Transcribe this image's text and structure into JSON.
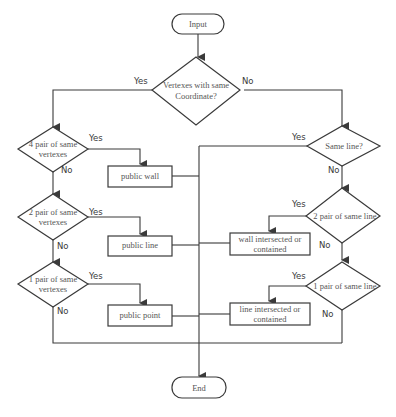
{
  "diagram": {
    "type": "flowchart",
    "nodes": {
      "start": {
        "label": "Input",
        "shape": "terminator"
      },
      "d_same_coord": {
        "line1": "Vertexes with same",
        "line2": "Coordinate?",
        "shape": "decision"
      },
      "d_4pair": {
        "line1": "4 pair of same",
        "line2": "vertexes",
        "shape": "decision"
      },
      "d_2pair": {
        "line1": "2 pair of same",
        "line2": "vertexes",
        "shape": "decision"
      },
      "d_1pair": {
        "line1": "1 pair of same",
        "line2": "vertexes",
        "shape": "decision"
      },
      "p_wall": {
        "label": "public wall",
        "shape": "process"
      },
      "p_line": {
        "label": "public line",
        "shape": "process"
      },
      "p_point": {
        "label": "public point",
        "shape": "process"
      },
      "d_same_line": {
        "label": "Same line?",
        "shape": "decision"
      },
      "d_2pair_line": {
        "label": "2 pair of same line",
        "shape": "decision"
      },
      "d_1pair_line": {
        "label": "1 pair of same line",
        "shape": "decision"
      },
      "p_wall_int": {
        "line1": "wall intersected or",
        "line2": "contained",
        "shape": "process"
      },
      "p_line_int": {
        "line1": "line intersected or",
        "line2": "contained",
        "shape": "process"
      },
      "end": {
        "label": "End",
        "shape": "terminator"
      }
    },
    "edge_labels": {
      "yes": "Yes",
      "no": "No"
    },
    "edges": [
      {
        "from": "start",
        "to": "d_same_coord"
      },
      {
        "from": "d_same_coord",
        "to": "d_4pair",
        "label": "Yes"
      },
      {
        "from": "d_same_coord",
        "to": "d_same_line",
        "label": "No"
      },
      {
        "from": "d_4pair",
        "to": "p_wall",
        "label": "Yes"
      },
      {
        "from": "d_4pair",
        "to": "d_2pair",
        "label": "No"
      },
      {
        "from": "d_2pair",
        "to": "p_line",
        "label": "Yes"
      },
      {
        "from": "d_2pair",
        "to": "d_1pair",
        "label": "No"
      },
      {
        "from": "d_1pair",
        "to": "p_point",
        "label": "Yes"
      },
      {
        "from": "d_1pair",
        "to": "end",
        "label": "No"
      },
      {
        "from": "d_same_line",
        "to": "end",
        "label": "Yes"
      },
      {
        "from": "d_same_line",
        "to": "d_2pair_line",
        "label": "No"
      },
      {
        "from": "d_2pair_line",
        "to": "p_wall_int",
        "label": "Yes"
      },
      {
        "from": "d_2pair_line",
        "to": "d_1pair_line",
        "label": "No"
      },
      {
        "from": "d_1pair_line",
        "to": "p_line_int",
        "label": "Yes"
      },
      {
        "from": "d_1pair_line",
        "to": "end",
        "label": "No"
      },
      {
        "from": "p_wall",
        "to": "end"
      },
      {
        "from": "p_line",
        "to": "end"
      },
      {
        "from": "p_point",
        "to": "end"
      },
      {
        "from": "p_wall_int",
        "to": "end"
      },
      {
        "from": "p_line_int",
        "to": "end"
      }
    ]
  }
}
